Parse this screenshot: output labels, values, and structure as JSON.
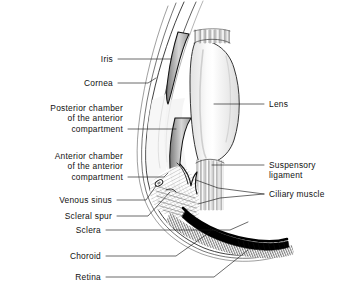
{
  "figure": {
    "type": "anatomical-diagram",
    "background_color": "#ffffff",
    "line_color": "#1a1a1a",
    "lens_fill": "#eeeeee",
    "choroid_fill": "#000000",
    "text_color": "#111111"
  },
  "labels": {
    "iris": "Iris",
    "cornea": "Cornea",
    "posterior_chamber": "Posterior chamber\nof the anterior\ncompartment",
    "anterior_chamber": "Anterior chamber\nof the anterior\ncompartment",
    "venous_sinus": "Venous sinus",
    "scleral_spur": "Scleral spur",
    "sclera": "Sclera",
    "choroid": "Choroid",
    "retina": "Retina",
    "lens": "Lens",
    "suspensory_ligament": "Suspensory\nligament",
    "ciliary_muscle": "Ciliary muscle"
  },
  "structures": [
    {
      "name": "iris",
      "side": "left",
      "description": "thin dark crescent between cornea and lens"
    },
    {
      "name": "cornea",
      "side": "left",
      "description": "outer transparent curved layers at front of eye"
    },
    {
      "name": "posterior-chamber",
      "side": "left",
      "description": "space behind iris, before lens"
    },
    {
      "name": "anterior-chamber",
      "side": "left",
      "description": "space between cornea and iris"
    },
    {
      "name": "venous-sinus",
      "side": "left",
      "description": "small oval canal of Schlemm"
    },
    {
      "name": "scleral-spur",
      "side": "left",
      "description": "ridge of sclera at iridocorneal angle"
    },
    {
      "name": "sclera",
      "side": "left",
      "description": "tough white outer coat"
    },
    {
      "name": "choroid",
      "side": "left",
      "description": "dark vascular layer, heavy black band"
    },
    {
      "name": "retina",
      "side": "left",
      "description": "innermost light-sensitive layer, hatched band"
    },
    {
      "name": "lens",
      "side": "right",
      "description": "large pale ellipse, biconvex"
    },
    {
      "name": "suspensory-ligament",
      "side": "right",
      "description": "vertical zonular fibers from lens to ciliary body"
    },
    {
      "name": "ciliary-muscle",
      "side": "right",
      "description": "cross-hatched muscle mass at lens equator"
    }
  ]
}
